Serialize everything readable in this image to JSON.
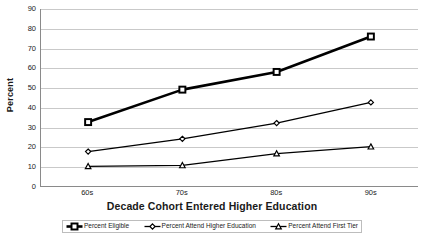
{
  "chart_data": {
    "type": "line",
    "title": "",
    "xlabel": "Decade Cohort Entered Higher Education",
    "ylabel": "Percent",
    "categories": [
      "60s",
      "70s",
      "80s",
      "90s"
    ],
    "ylim": [
      0,
      90
    ],
    "yticks": [
      0,
      10,
      20,
      30,
      40,
      50,
      60,
      70,
      80,
      90
    ],
    "grid": true,
    "legend_position": "bottom",
    "series": [
      {
        "name": "Percent Eligible",
        "marker": "square",
        "values": [
          32.5,
          49,
          58,
          76
        ]
      },
      {
        "name": "Percent Attend Higher Education",
        "marker": "diamond",
        "values": [
          17.5,
          24,
          32,
          42.5
        ]
      },
      {
        "name": "Percent Attend First Tier",
        "marker": "triangle",
        "values": [
          10,
          10.5,
          16.5,
          20
        ]
      }
    ]
  },
  "colors": {
    "line": "#000000",
    "marker_fill": "#ffffff",
    "gridline": "#c9c9c9",
    "axis": "#8a8a8a",
    "background": "#ffffff",
    "text": "#1a1a1a"
  }
}
